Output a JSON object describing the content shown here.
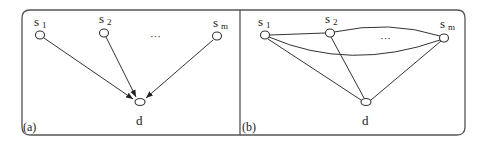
{
  "figure": {
    "panels": [
      {
        "id": "a",
        "tag": "(a)",
        "type": "directed",
        "nodes": [
          {
            "id": "s1",
            "label": "s",
            "subscript": "1"
          },
          {
            "id": "s2",
            "label": "s",
            "subscript": "2"
          },
          {
            "id": "sm",
            "label": "s",
            "subscript": "m"
          },
          {
            "id": "d",
            "label": "d",
            "subscript": ""
          }
        ],
        "ellipsis": "···",
        "edges": [
          {
            "from": "s1",
            "to": "d",
            "directed": true
          },
          {
            "from": "s2",
            "to": "d",
            "directed": true
          },
          {
            "from": "sm",
            "to": "d",
            "directed": true
          }
        ]
      },
      {
        "id": "b",
        "tag": "(b)",
        "type": "undirected",
        "nodes": [
          {
            "id": "s1",
            "label": "s",
            "subscript": "1"
          },
          {
            "id": "s2",
            "label": "s",
            "subscript": "2"
          },
          {
            "id": "sm",
            "label": "s",
            "subscript": "m"
          },
          {
            "id": "d",
            "label": "d",
            "subscript": ""
          }
        ],
        "ellipsis": "···",
        "edges": [
          {
            "from": "s1",
            "to": "s2",
            "directed": false
          },
          {
            "from": "s2",
            "to": "sm",
            "directed": false
          },
          {
            "from": "s1",
            "to": "sm",
            "directed": false
          },
          {
            "from": "s1",
            "to": "d",
            "directed": false
          },
          {
            "from": "s2",
            "to": "d",
            "directed": false
          },
          {
            "from": "sm",
            "to": "d",
            "directed": false
          }
        ]
      }
    ]
  }
}
